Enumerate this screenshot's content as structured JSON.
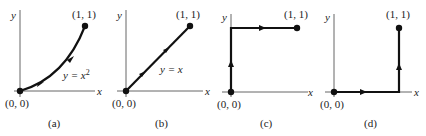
{
  "figure": {
    "panels": [
      {
        "id": "a",
        "caption": "(a)",
        "axis_x": "x",
        "axis_y": "y",
        "start_label": "(0, 0)",
        "end_label": "(1, 1)",
        "curve_label_prefix": "y = x",
        "curve_label_sup": "2",
        "path_type": "parabola y = x^2"
      },
      {
        "id": "b",
        "caption": "(b)",
        "axis_x": "x",
        "axis_y": "y",
        "start_label": "(0, 0)",
        "end_label": "(1, 1)",
        "curve_label": "y = x",
        "path_type": "line y = x"
      },
      {
        "id": "c",
        "caption": "(c)",
        "axis_x": "x",
        "axis_y": "y",
        "start_label": "(0, 0)",
        "end_label": "(1, 1)",
        "path_type": "up y-axis then right to (1,1)"
      },
      {
        "id": "d",
        "caption": "(d)",
        "axis_x": "x",
        "axis_y": "y",
        "start_label": "(0, 0)",
        "end_label": "(1, 1)",
        "path_type": "right along x-axis then up to (1,1)"
      }
    ]
  }
}
